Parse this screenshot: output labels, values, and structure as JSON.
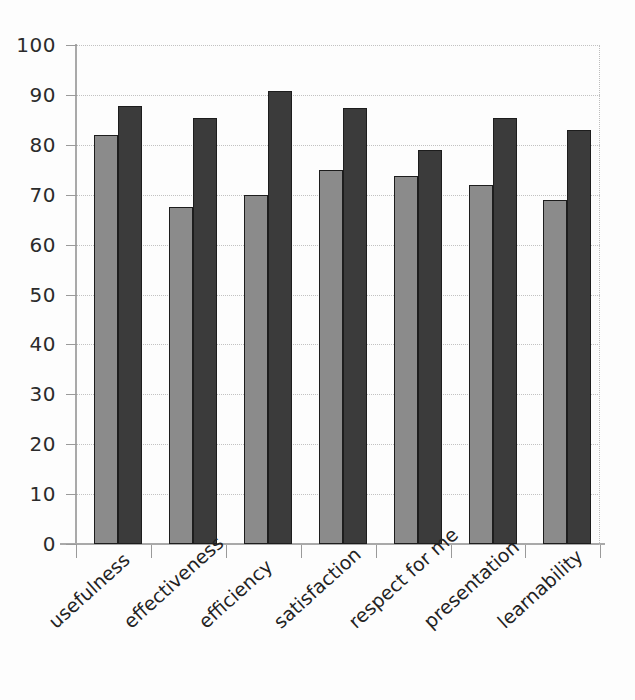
{
  "chart_data": {
    "type": "bar",
    "title": "",
    "subtitle": "",
    "xlabel": "",
    "ylabel": "",
    "ylim": [
      0,
      100
    ],
    "ytick_labels": [
      "100",
      "90",
      "80",
      "70",
      "60",
      "50",
      "40",
      "30",
      "20",
      "10",
      "0"
    ],
    "ytick_values": [
      100,
      90,
      80,
      70,
      60,
      50,
      40,
      30,
      20,
      10,
      0
    ],
    "grid": true,
    "grid_style": "horizontal-dotted",
    "legend": false,
    "legend_position": "none",
    "annotations": [],
    "categories": [
      "usefulness",
      "effectiveness",
      "efficiency",
      "satisfaction",
      "respect for me",
      "presentation",
      "learnability"
    ],
    "series": [
      {
        "name": "series-a",
        "color": "#8b8b8b",
        "values": [
          82,
          67.5,
          70,
          75,
          73.7,
          72,
          69
        ]
      },
      {
        "name": "series-b",
        "color": "#3b3b3b",
        "values": [
          87.7,
          85.4,
          90.7,
          87.4,
          79,
          85.4,
          83
        ]
      }
    ]
  },
  "colors": {
    "series_a": "#8b8b8b",
    "series_b": "#3b3b3b",
    "bar_outline": "#1d1d1d",
    "axis": "#a9a9a9",
    "gridline": "#c2c2c2",
    "text": "#232323",
    "background": "#fdfdfd"
  }
}
